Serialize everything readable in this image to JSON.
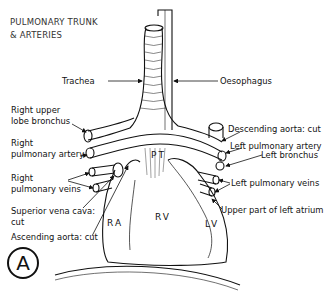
{
  "title": {
    "line1": "PULMONARY TRUNK",
    "line2": "& ARTERIES"
  },
  "labels": {
    "trachea": "Trachea",
    "oesophagus": "Oesophagus",
    "right_upper_lobe_bronchus_1": "Right upper",
    "right_upper_lobe_bronchus_2": "lobe bronchus",
    "right_pulmonary_artery_1": "Right",
    "right_pulmonary_artery_2": "pulmonary artery",
    "right_pulmonary_veins_1": "Right",
    "right_pulmonary_veins_2": "pulmonary veins",
    "superior_vena_cava_1": "Superior vena cava:",
    "superior_vena_cava_2": "cut",
    "ascending_aorta": "Ascending aorta: cut",
    "descending_aorta": "Descending aorta: cut",
    "left_pulmonary_artery": "Left pulmonary artery",
    "left_bronchus": "Left bronchus",
    "left_pulmonary_veins": "Left pulmonary veins",
    "upper_left_atrium": "Upper part of left atrium"
  },
  "chambers": {
    "pt": "PT",
    "ra": "RA",
    "rv": "RV",
    "lv": "LV"
  },
  "panel_letter": "A"
}
